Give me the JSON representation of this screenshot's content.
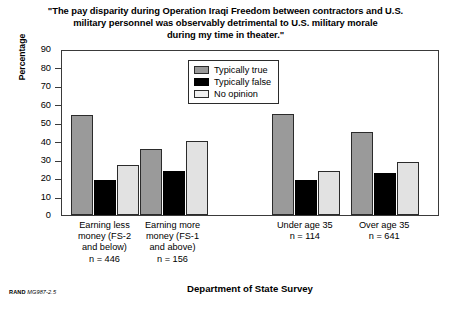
{
  "chart_data": {
    "type": "bar",
    "title": "\"The pay disparity during Operation Iraqi Freedom between contractors and U.S. military personnel was observably detrimental to U.S. military morale during my time in theater.\"",
    "title_lines": [
      "\"The pay disparity during Operation Iraqi Freedom between contractors and U.S.",
      "military personnel was observably detrimental to U.S. military morale",
      "during my time in theater.\""
    ],
    "xlabel": "Department of State Survey",
    "ylabel": "Percentage",
    "ylim": [
      0,
      90
    ],
    "ytick_values": [
      0,
      10,
      20,
      30,
      40,
      50,
      60,
      70,
      80,
      90
    ],
    "ytick_labels": [
      "0",
      "10",
      "20",
      "30",
      "40",
      "50",
      "60",
      "70",
      "80",
      "90"
    ],
    "grid": false,
    "legend_position": "upper center inside plot",
    "categories": [
      "Earning less money (FS-2 and below) n = 446",
      "Earning more money (FS-1 and above) n = 156",
      "Under age 35 n = 114",
      "Over age 35 n = 641"
    ],
    "category_lines": [
      [
        "Earning less",
        "money (FS-2",
        "and below)",
        "n = 446"
      ],
      [
        "Earning more",
        "money (FS-1",
        "and above)",
        "n = 156"
      ],
      [
        "Under age 35",
        "n = 114"
      ],
      [
        "Over age 35",
        "n = 641"
      ]
    ],
    "series": [
      {
        "name": "Typically true",
        "color": "#9a9a9a",
        "values": [
          54,
          36,
          55,
          45
        ]
      },
      {
        "name": "Typically false",
        "color": "#000000",
        "values": [
          19,
          24,
          19,
          23
        ]
      },
      {
        "name": "No opinion",
        "color": "#e2e2e2",
        "values": [
          27,
          40,
          24,
          29
        ]
      }
    ]
  },
  "legend": {
    "items": [
      {
        "label": "Typically true"
      },
      {
        "label": "Typically false"
      },
      {
        "label": "No opinion"
      }
    ]
  },
  "footer": {
    "rand_mark": "RAND",
    "rand_id": "MG987-2.5"
  }
}
